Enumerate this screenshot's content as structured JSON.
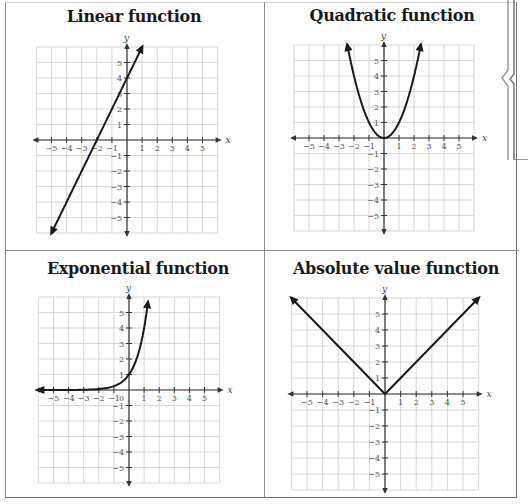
{
  "panels": [
    {
      "title": "Linear function",
      "x_label": "x",
      "y_label": "y"
    },
    {
      "title": "Quadratic function",
      "x_label": "x",
      "y_label": "y"
    },
    {
      "title": "Exponential function",
      "x_label": "x",
      "y_label": "y",
      "origin_label": "0"
    },
    {
      "title": "Absolute value function",
      "x_label": "x",
      "y_label": "y"
    }
  ],
  "colors": {
    "curve": "#1a1a1a",
    "grid": "#d6d6d6",
    "axis": "#333333",
    "border": "#8a8a8a"
  },
  "chart_data": [
    {
      "type": "line",
      "title": "Linear function",
      "xlabel": "x",
      "ylabel": "y",
      "xlim": [
        -6,
        6
      ],
      "ylim": [
        -6,
        6
      ],
      "xticks": [
        -5,
        -4,
        -3,
        -2,
        -1,
        1,
        2,
        3,
        4,
        5
      ],
      "yticks": [
        -5,
        -4,
        -3,
        -2,
        -1,
        1,
        2,
        3,
        4,
        5
      ],
      "grid": true,
      "equation": "y = 2x + 4",
      "series": [
        {
          "name": "linear",
          "x": [
            -5,
            -2,
            0,
            1
          ],
          "y": [
            -6,
            0,
            4,
            6
          ]
        }
      ],
      "arrows": "both ends"
    },
    {
      "type": "line",
      "title": "Quadratic function",
      "xlabel": "x",
      "ylabel": "y",
      "xlim": [
        -6,
        6
      ],
      "ylim": [
        -6,
        6
      ],
      "xticks": [
        -5,
        -4,
        -3,
        -2,
        -1,
        1,
        2,
        3,
        4,
        5
      ],
      "yticks": [
        -5,
        -4,
        -3,
        -2,
        -1,
        1,
        2,
        3,
        4,
        5
      ],
      "grid": true,
      "equation": "y = x^2",
      "series": [
        {
          "name": "quadratic",
          "x": [
            -2.45,
            -2,
            -1,
            0,
            1,
            2,
            2.45
          ],
          "y": [
            6,
            4,
            1,
            0,
            1,
            4,
            6
          ]
        }
      ],
      "arrows": "both ends"
    },
    {
      "type": "line",
      "title": "Exponential function",
      "xlabel": "x",
      "ylabel": "y",
      "xlim": [
        -6,
        6
      ],
      "ylim": [
        -6,
        6
      ],
      "xticks": [
        -5,
        -4,
        -3,
        -2,
        -1,
        1,
        2,
        3,
        4,
        5
      ],
      "yticks": [
        -5,
        -4,
        -3,
        -2,
        -1,
        1,
        2,
        3,
        4,
        5
      ],
      "grid": true,
      "equation": "y = 4^x (approx.)",
      "series": [
        {
          "name": "exponential",
          "x": [
            -6,
            -3,
            -2,
            -1,
            0,
            0.5,
            1,
            1.29
          ],
          "y": [
            0,
            0.02,
            0.06,
            0.25,
            1,
            2,
            4,
            6
          ]
        }
      ],
      "arrows": "both ends"
    },
    {
      "type": "line",
      "title": "Absolute value function",
      "xlabel": "x",
      "ylabel": "y",
      "xlim": [
        -6,
        6
      ],
      "ylim": [
        -6,
        6
      ],
      "xticks": [
        -5,
        -4,
        -3,
        -2,
        -1,
        1,
        2,
        3,
        4,
        5
      ],
      "yticks": [
        -5,
        -4,
        -3,
        -2,
        -1,
        1,
        2,
        3,
        4,
        5
      ],
      "grid": true,
      "equation": "y = |x|",
      "series": [
        {
          "name": "absolute value",
          "x": [
            -6,
            0,
            6
          ],
          "y": [
            6,
            0,
            6
          ]
        }
      ],
      "arrows": "both ends"
    }
  ]
}
